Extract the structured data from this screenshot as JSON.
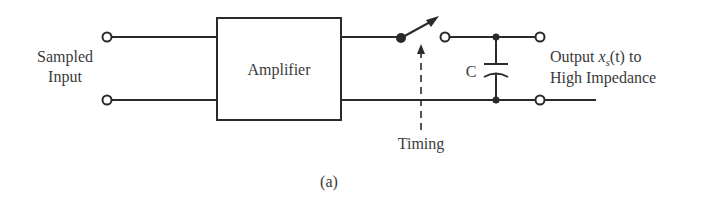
{
  "figure": {
    "caption": "(a)",
    "background": "#ffffff",
    "ink_color": "#2a2a2a"
  },
  "input": {
    "label_line1": "Sampled",
    "label_line2": "Input"
  },
  "amplifier": {
    "label": "Amplifier"
  },
  "switch": {
    "control_label": "Timing"
  },
  "capacitor": {
    "label": "C"
  },
  "output": {
    "label_prefix": "Output ",
    "label_var": "x",
    "label_sub": "s",
    "label_arg": "(t)",
    "label_suffix": " to",
    "label_line2": "High Impedance"
  }
}
